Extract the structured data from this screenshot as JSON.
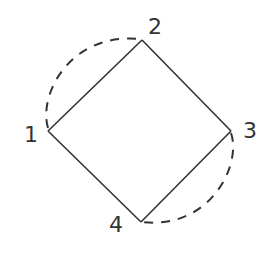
{
  "diagram": {
    "type": "graph",
    "nodes": [
      {
        "id": "1",
        "label": "1",
        "x": 48,
        "y": 131
      },
      {
        "id": "2",
        "label": "2",
        "x": 142,
        "y": 40
      },
      {
        "id": "3",
        "label": "3",
        "x": 231,
        "y": 131
      },
      {
        "id": "4",
        "label": "4",
        "x": 141,
        "y": 222
      }
    ],
    "edges": [
      {
        "from": "1",
        "to": "2",
        "style": "solid"
      },
      {
        "from": "2",
        "to": "3",
        "style": "solid"
      },
      {
        "from": "3",
        "to": "4",
        "style": "solid"
      },
      {
        "from": "4",
        "to": "1",
        "style": "solid"
      },
      {
        "from": "1",
        "to": "2",
        "style": "dashed",
        "curve": "arc"
      },
      {
        "from": "3",
        "to": "4",
        "style": "dashed",
        "curve": "arc"
      }
    ],
    "colors": {
      "stroke": "#333333",
      "background": "#ffffff"
    }
  }
}
